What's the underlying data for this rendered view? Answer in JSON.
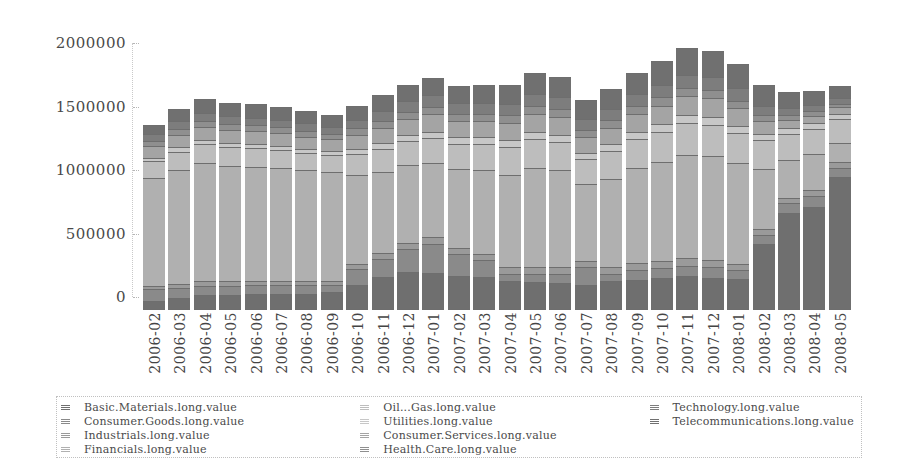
{
  "chart_data": {
    "type": "bar",
    "stacked": true,
    "title": "",
    "xlabel": "",
    "ylabel": "",
    "ylim": [
      0,
      2100000
    ],
    "yticks": [
      0,
      500000,
      1000000,
      1500000,
      2000000
    ],
    "ytick_labels": [
      "0",
      "500000",
      "1000000",
      "1500000",
      "2000000"
    ],
    "grid": false,
    "legend_position": "bottom",
    "categories": [
      "2006-02",
      "2006-03",
      "2006-04",
      "2006-05",
      "2006-06",
      "2006-07",
      "2006-08",
      "2006-09",
      "2006-10",
      "2006-11",
      "2006-12",
      "2007-01",
      "2007-02",
      "2007-03",
      "2007-04",
      "2007-05",
      "2007-06",
      "2007-07",
      "2007-08",
      "2007-09",
      "2007-10",
      "2007-11",
      "2007-12",
      "2008-01",
      "2008-02",
      "2008-03",
      "2008-04",
      "2008-05"
    ],
    "series": [
      {
        "name": "Basic.Materials.long.value",
        "color": "#6f6f6f",
        "values": [
          70000,
          95000,
          115000,
          120000,
          130000,
          125000,
          130000,
          140000,
          200000,
          260000,
          300000,
          290000,
          270000,
          260000,
          230000,
          220000,
          215000,
          200000,
          225000,
          240000,
          250000,
          265000,
          255000,
          245000,
          520000,
          760000,
          810000,
          1050000
        ]
      },
      {
        "name": "Consumer.Goods.long.value",
        "color": "#8a8a8a",
        "values": [
          95000,
          80000,
          75000,
          70000,
          65000,
          70000,
          70000,
          60000,
          120000,
          145000,
          180000,
          230000,
          170000,
          130000,
          55000,
          60000,
          70000,
          140000,
          60000,
          75000,
          80000,
          85000,
          80000,
          70000,
          70000,
          80000,
          90000,
          70000
        ]
      },
      {
        "name": "Industrials.long.value",
        "color": "#9a9a9a",
        "values": [
          25000,
          30000,
          35000,
          35000,
          35000,
          35000,
          30000,
          30000,
          40000,
          45000,
          50000,
          55000,
          50000,
          50000,
          50000,
          55000,
          55000,
          50000,
          50000,
          55000,
          55000,
          60000,
          55000,
          50000,
          50000,
          45000,
          45000,
          45000
        ]
      },
      {
        "name": "Financials.long.value",
        "color": "#b0b0b0",
        "values": [
          850000,
          900000,
          930000,
          910000,
          900000,
          890000,
          870000,
          860000,
          700000,
          640000,
          610000,
          580000,
          620000,
          660000,
          730000,
          780000,
          760000,
          600000,
          700000,
          750000,
          780000,
          810000,
          820000,
          790000,
          470000,
          300000,
          280000,
          150000
        ]
      },
      {
        "name": "Oil...Gas.long.value",
        "color": "#bdbdbd",
        "values": [
          130000,
          140000,
          150000,
          145000,
          145000,
          140000,
          135000,
          130000,
          170000,
          180000,
          190000,
          200000,
          200000,
          210000,
          220000,
          230000,
          225000,
          200000,
          215000,
          230000,
          240000,
          255000,
          250000,
          240000,
          230000,
          200000,
          200000,
          190000
        ]
      },
      {
        "name": "Utilities.long.value",
        "color": "#c7c7c7",
        "values": [
          30000,
          35000,
          35000,
          35000,
          35000,
          35000,
          35000,
          35000,
          40000,
          45000,
          45000,
          50000,
          50000,
          50000,
          55000,
          60000,
          55000,
          50000,
          55000,
          55000,
          60000,
          60000,
          60000,
          55000,
          50000,
          45000,
          45000,
          40000
        ]
      },
      {
        "name": "Consumer.Services.long.value",
        "color": "#a4a4a4",
        "values": [
          95000,
          100000,
          105000,
          105000,
          100000,
          100000,
          95000,
          90000,
          110000,
          120000,
          130000,
          135000,
          130000,
          130000,
          135000,
          140000,
          140000,
          125000,
          130000,
          140000,
          145000,
          150000,
          150000,
          140000,
          100000,
          70000,
          60000,
          50000
        ]
      },
      {
        "name": "Health.Care.long.value",
        "color": "#8f8f8f",
        "values": [
          40000,
          45000,
          45000,
          45000,
          45000,
          45000,
          45000,
          45000,
          50000,
          55000,
          55000,
          60000,
          55000,
          55000,
          60000,
          60000,
          60000,
          55000,
          60000,
          60000,
          65000,
          65000,
          65000,
          60000,
          45000,
          35000,
          35000,
          30000
        ]
      },
      {
        "name": "Technology.long.value",
        "color": "#7d7d7d",
        "values": [
          55000,
          60000,
          60000,
          60000,
          60000,
          60000,
          60000,
          55000,
          70000,
          80000,
          85000,
          90000,
          85000,
          85000,
          90000,
          95000,
          95000,
          85000,
          90000,
          95000,
          100000,
          105000,
          100000,
          95000,
          75000,
          55000,
          50000,
          45000
        ]
      },
      {
        "name": "Telecommunications.long.value",
        "color": "#707070",
        "values": [
          65000,
          95000,
          110000,
          105000,
          105000,
          100000,
          100000,
          95000,
          110000,
          125000,
          130000,
          135000,
          135000,
          140000,
          150000,
          165000,
          160000,
          150000,
          155000,
          170000,
          185000,
          210000,
          205000,
          195000,
          160000,
          125000,
          110000,
          95000
        ]
      }
    ]
  },
  "legend": {
    "columns": [
      [
        "Basic.Materials.long.value",
        "Consumer.Goods.long.value",
        "Industrials.long.value",
        "Financials.long.value"
      ],
      [
        "Oil...Gas.long.value",
        "Utilities.long.value",
        "Consumer.Services.long.value",
        "Health.Care.long.value"
      ],
      [
        "Technology.long.value",
        "Telecommunications.long.value"
      ]
    ]
  }
}
